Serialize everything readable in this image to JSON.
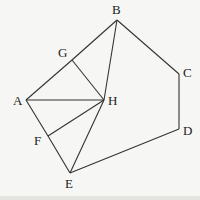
{
  "diagram": {
    "vertices": {
      "A": {
        "label": "A",
        "x": 26,
        "y": 100,
        "lx": 13,
        "ly": 105
      },
      "B": {
        "label": "B",
        "x": 117,
        "y": 20,
        "lx": 112,
        "ly": 14
      },
      "C": {
        "label": "C",
        "x": 179,
        "y": 74,
        "lx": 183,
        "ly": 77
      },
      "D": {
        "label": "D",
        "x": 179,
        "y": 129,
        "lx": 183,
        "ly": 135
      },
      "E": {
        "label": "E",
        "x": 70,
        "y": 173,
        "lx": 65,
        "ly": 188
      },
      "F": {
        "label": "F",
        "x": 48,
        "y": 136,
        "lx": 34,
        "ly": 145
      },
      "G": {
        "label": "G",
        "x": 72,
        "y": 60,
        "lx": 58,
        "ly": 57
      },
      "H": {
        "label": "H",
        "x": 104,
        "y": 100,
        "lx": 108,
        "ly": 105
      }
    },
    "edges": [
      [
        "A",
        "G"
      ],
      [
        "G",
        "B"
      ],
      [
        "B",
        "C"
      ],
      [
        "C",
        "D"
      ],
      [
        "D",
        "E"
      ],
      [
        "E",
        "F"
      ],
      [
        "F",
        "A"
      ],
      [
        "A",
        "H"
      ],
      [
        "G",
        "H"
      ],
      [
        "B",
        "H"
      ],
      [
        "F",
        "H"
      ],
      [
        "E",
        "H"
      ]
    ]
  }
}
